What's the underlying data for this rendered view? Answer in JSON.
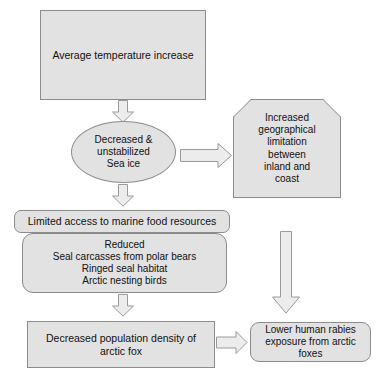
{
  "diagram": {
    "style": {
      "node_fill": "#e2e2e2",
      "node_border": "#8c8c8c",
      "arrow_fill": "#ececec",
      "arrow_border": "#9a9a9a",
      "text_color": "#111111",
      "background": "#ffffff"
    },
    "nodes": [
      {
        "id": "avg-temp",
        "shape": "rectangle",
        "text": "Average temperature increase"
      },
      {
        "id": "sea-ice",
        "shape": "ellipse",
        "text": "Decreased &\nunstabilized\nSea ice"
      },
      {
        "id": "geo-limit",
        "shape": "top-beveled-rectangle",
        "text": "Increased\ngeographical\nlimitation\nbetween\ninland and\ncoast"
      },
      {
        "id": "limited-access",
        "shape": "rounded-rectangle",
        "text": "Limited access to marine food resources"
      },
      {
        "id": "reduced-list",
        "shape": "rounded-rectangle",
        "text": "Reduced\nSeal carcasses from polar bears\nRinged seal habitat\nArctic nesting birds"
      },
      {
        "id": "fox-density",
        "shape": "rectangle",
        "text": "Decreased population density of\narctic fox"
      },
      {
        "id": "rabies",
        "shape": "rounded-rectangle",
        "text": "Lower human rabies\nexposure from arctic\nfoxes"
      }
    ],
    "arrows": [
      {
        "id": "temp-to-seaice",
        "direction": "down",
        "from": "avg-temp",
        "to": "sea-ice"
      },
      {
        "id": "seaice-to-geo",
        "direction": "right",
        "from": "sea-ice",
        "to": "geo-limit"
      },
      {
        "id": "seaice-to-food",
        "direction": "down",
        "from": "sea-ice",
        "to": "limited-access"
      },
      {
        "id": "geo-to-rabies",
        "direction": "down",
        "from": "geo-limit",
        "to": "rabies"
      },
      {
        "id": "food-to-fox",
        "direction": "down",
        "from": "reduced-list",
        "to": "fox-density"
      },
      {
        "id": "fox-to-rabies",
        "direction": "right",
        "from": "fox-density",
        "to": "rabies"
      }
    ]
  }
}
